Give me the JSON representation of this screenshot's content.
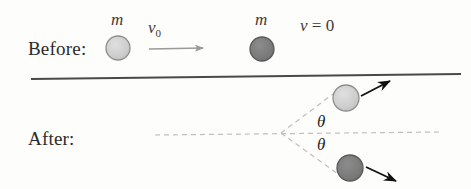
{
  "figure": {
    "background_color": "#fdfdfc",
    "width": 471,
    "height": 189
  },
  "labels": {
    "before": "Before:",
    "after": "After:"
  },
  "before_stage": {
    "incoming_ball": {
      "mass_label": "m",
      "velocity_label": "v",
      "velocity_subscript": "0",
      "fill_color": "#cfcfcf",
      "stroke_color": "#8f8f8f",
      "center_x": 118,
      "center_y": 48,
      "radius": 12
    },
    "target_ball": {
      "mass_label": "m",
      "velocity_text": "= 0",
      "velocity_symbol": "v",
      "fill_color": "#7d7d7d",
      "stroke_color": "#5a5a5a",
      "center_x": 262,
      "center_y": 49,
      "radius": 12
    },
    "velocity_arrow": {
      "name": "v0-arrow",
      "from_x": 149,
      "from_y": 49,
      "to_x": 207,
      "to_y": 48,
      "color": "#9a9a9a"
    }
  },
  "surface_line": {
    "name": "horizontal-surface",
    "from_x": 31,
    "from_y": 79,
    "to_x": 461,
    "to_y": 74,
    "color": "#4a4a4a"
  },
  "after_stage": {
    "vertex_x": 281,
    "vertex_y": 133,
    "axis_line": {
      "from_x": 155,
      "from_y": 135,
      "to_x": 440,
      "to_y": 132,
      "color": "#c0bcbc",
      "style": "dashed"
    },
    "upper_ball": {
      "fill_color": "#cfcfcf",
      "stroke_color": "#8f8f8f",
      "center_x": 346,
      "center_y": 98,
      "radius": 13
    },
    "lower_ball": {
      "fill_color": "#7d7d7d",
      "stroke_color": "#5a5a5a",
      "center_x": 350,
      "center_y": 168,
      "radius": 13
    },
    "upper_guide": {
      "from_x": 281,
      "from_y": 133,
      "to_x": 340,
      "to_y": 88,
      "color": "#c0bcbc",
      "style": "dashed"
    },
    "lower_guide": {
      "from_x": 281,
      "from_y": 133,
      "to_x": 345,
      "to_y": 178,
      "color": "#c0bcbc",
      "style": "dashed"
    },
    "angle_top_label": "θ",
    "angle_bottom_label": "θ",
    "upper_arrow": {
      "name": "upper-velocity-arrow",
      "from_x": 361,
      "from_y": 96,
      "to_x": 394,
      "to_y": 79,
      "color": "#111111"
    },
    "lower_arrow": {
      "name": "lower-velocity-arrow",
      "from_x": 366,
      "from_y": 167,
      "to_x": 400,
      "to_y": 184,
      "color": "#111111"
    }
  }
}
